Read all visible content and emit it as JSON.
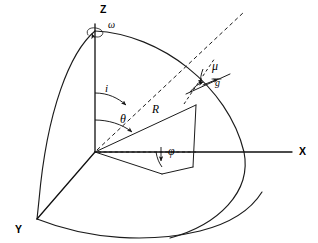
{
  "figure": {
    "background_color": "#ffffff",
    "line_color": "#1b1b1b",
    "width": 318,
    "height": 243
  },
  "axes": [
    {
      "id": "z",
      "label": "Z",
      "label_x": 100,
      "label_y": 13,
      "description": "vertical rotation axis"
    },
    {
      "id": "x",
      "label": "X",
      "label_x": 299,
      "label_y": 155,
      "description": "axis to the right"
    },
    {
      "id": "y",
      "label": "Y",
      "label_x": 15,
      "label_y": 233,
      "description": "axis to the lower left"
    }
  ],
  "annotations": [
    {
      "id": "omega",
      "label": "ω",
      "label_x": 108,
      "label_y": 28,
      "meaning": "rotation rate about Z axis"
    },
    {
      "id": "inclination",
      "label": "i",
      "label_x": 105,
      "label_y": 92,
      "meaning": "inclination angle from Z axis to orbit normal"
    },
    {
      "id": "theta",
      "label": "θ",
      "label_x": 120,
      "label_y": 123,
      "meaning": "colatitude angle from Z axis to R vector"
    },
    {
      "id": "radius",
      "label": "R",
      "label_x": 152,
      "label_y": 113,
      "meaning": "position radius vector"
    },
    {
      "id": "mu",
      "label": "μ",
      "label_x": 212,
      "label_y": 70,
      "meaning": "angle between orbit track and reference direction"
    },
    {
      "id": "g",
      "label": "g",
      "label_x": 215,
      "label_y": 86,
      "meaning": "ground track direction vector"
    },
    {
      "id": "phi",
      "label": "φ",
      "label_x": 168,
      "label_y": 155,
      "meaning": "azimuth / longitude angle in the equatorial plane"
    }
  ],
  "geometry": {
    "origin": {
      "x": 95,
      "y": 152
    },
    "z_top": {
      "x": 95,
      "y": 24
    },
    "x_end": {
      "x": 292,
      "y": 152
    },
    "y_end": {
      "x": 37,
      "y": 219
    },
    "r_tip": {
      "x": 196,
      "y": 105
    },
    "r_foot": {
      "x": 193,
      "y": 167
    },
    "phi_base": {
      "x": 162,
      "y": 174
    },
    "dashed_line_start": {
      "x": 97,
      "y": 150
    },
    "dashed_line_end": {
      "x": 244,
      "y": 12
    }
  },
  "curves": {
    "left_meridian": "arc from Z pole to Y endpoint",
    "right_meridian": "arc from Z pole past X axis to lower right",
    "equator": "arc from Y endpoint sweeping right",
    "orbit_track": "great-circle track crossing near R tip"
  }
}
